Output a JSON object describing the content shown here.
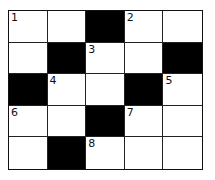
{
  "puzzle": {
    "type": "crossword",
    "rows": 5,
    "cols": 5,
    "grid": [
      [
        "1",
        "",
        "#",
        "2",
        ""
      ],
      [
        "",
        "#",
        "3",
        "",
        "#"
      ],
      [
        "#",
        "4",
        "",
        "#",
        "5"
      ],
      [
        "6",
        "",
        "#",
        "7",
        ""
      ],
      [
        "",
        "#",
        "8",
        "",
        ""
      ]
    ]
  }
}
